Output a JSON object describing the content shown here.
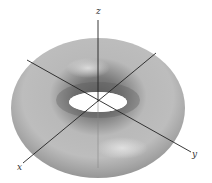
{
  "figure": {
    "surface": "torus",
    "colors": {
      "background": "#ffffff",
      "surface_light": "#d6d6d6",
      "surface_mid": "#a8a8a8",
      "surface_dark": "#6e6e6e",
      "axis": "#222222"
    },
    "axes": {
      "x": {
        "label": "x"
      },
      "y": {
        "label": "y"
      },
      "z": {
        "label": "z"
      }
    }
  }
}
